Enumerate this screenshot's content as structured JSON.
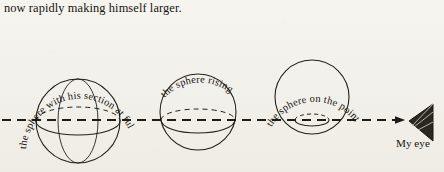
{
  "page": {
    "background_color": "#f4f2ec",
    "ink_color": "#1a1a1a",
    "width": 444,
    "height": 172
  },
  "caption": {
    "text": "now rapidly making himself larger."
  },
  "figure": {
    "name": "sphere-passing-through-plane-diagram",
    "sight_line": {
      "label": "dashed line of sight",
      "y": 120,
      "x_start": 2,
      "x_end": 412,
      "style": "dashed",
      "arrowhead": "right"
    },
    "spheres": [
      {
        "id": "sphere-full-size",
        "label": "the sphere with his section at full size",
        "cx": 78,
        "cy": 121,
        "r": 42,
        "section_ellipse_ry": 14,
        "section_offset_y": 0
      },
      {
        "id": "sphere-rising",
        "label": "the sphere rising",
        "cx": 198,
        "cy": 112,
        "r": 38,
        "section_ellipse_ry": 11,
        "section_offset_y": 8
      },
      {
        "id": "sphere-vanishing",
        "label": "the sphere on the point of vanishing",
        "cx": 312,
        "cy": 97,
        "r": 37,
        "section_ellipse_ry": 5,
        "section_offset_y": 23
      }
    ],
    "eye": {
      "label": "My eye",
      "icon": "eye-wedge-icon",
      "x": 412,
      "y": 120
    }
  }
}
